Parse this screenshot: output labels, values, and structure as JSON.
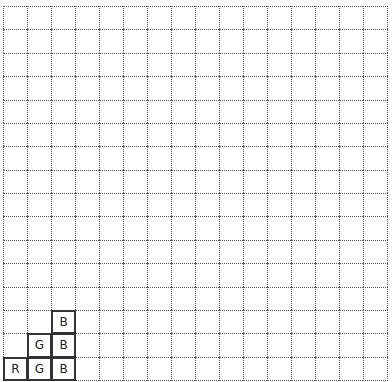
{
  "board": {
    "cols": 16,
    "rows": 16,
    "cell_width": 24,
    "cell_height": 23.375,
    "line_style": "dotted",
    "line_color": "#555555",
    "background": "#ffffff"
  },
  "pieces": [
    {
      "label": "B",
      "col": 2,
      "row": 13
    },
    {
      "label": "G",
      "col": 1,
      "row": 14
    },
    {
      "label": "B",
      "col": 2,
      "row": 14
    },
    {
      "label": "R",
      "col": 0,
      "row": 15
    },
    {
      "label": "G",
      "col": 1,
      "row": 15
    },
    {
      "label": "B",
      "col": 2,
      "row": 15
    }
  ],
  "piece_style": {
    "border_color": "#333333",
    "text_color": "#222222"
  }
}
